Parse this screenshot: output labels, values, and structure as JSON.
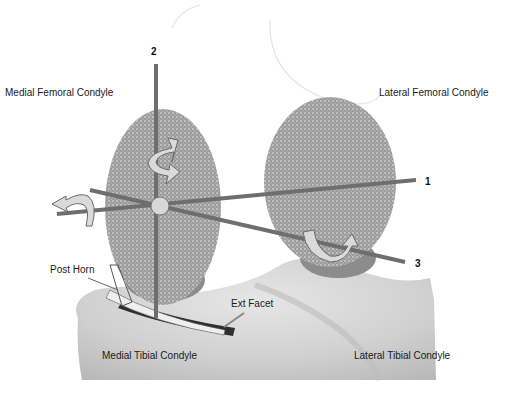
{
  "diagram": {
    "colors": {
      "background": "#ffffff",
      "condyle_fill": "#9a9a9a",
      "condyle_dots": "#c8c8c8",
      "condyle_base": "#8a8a8a",
      "tibia_fill": "#d6d6d6",
      "tibia_shadow": "#b4b4b4",
      "axis": "#6e6e6e",
      "arrow_fill": "#d9d9d9",
      "arrow_stroke": "#6a6a6a",
      "meniscus_dark": "#2e2e2e",
      "meniscus_light": "#eeeeee",
      "label_text": "#1a1a1a"
    },
    "labels": {
      "medial_femoral_condyle": "Medial Femoral Condyle",
      "lateral_femoral_condyle": "Lateral Femoral Condyle",
      "medial_tibial_condyle": "Medial Tibial Condyle",
      "lateral_tibial_condyle": "Lateral Tibial Condyle",
      "post_horn": "Post Horn",
      "ext_facet": "Ext Facet"
    },
    "axes": [
      {
        "id": "1",
        "label": "1",
        "description": "Transverse (flexion) axis"
      },
      {
        "id": "2",
        "label": "2",
        "description": "Longitudinal (vertical) axis"
      },
      {
        "id": "3",
        "label": "3",
        "description": "Oblique axis"
      }
    ]
  }
}
